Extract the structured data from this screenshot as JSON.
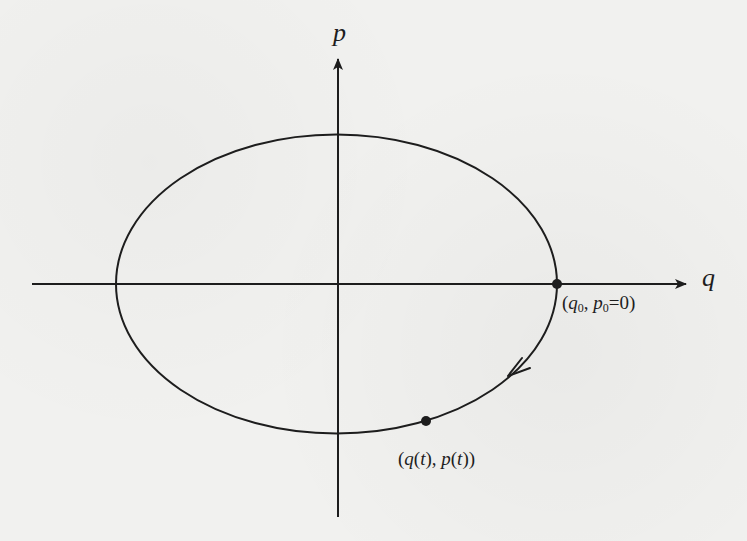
{
  "figure": {
    "type": "phase-space-diagram",
    "axes": {
      "horizontal": {
        "label": "q",
        "from_x": 32,
        "to_x": 688,
        "y": 284
      },
      "vertical": {
        "label": "p",
        "from_y": 517,
        "to_y": 57,
        "x": 338
      }
    },
    "trajectory": {
      "shape": "ellipse",
      "center": [
        336.5,
        284
      ],
      "radius_x": 220.5,
      "radius_y": 149.5,
      "direction": "clockwise",
      "arrow_at": [
        515,
        372
      ]
    },
    "points": [
      {
        "id": "initial",
        "x": 557,
        "y": 284,
        "label_parts": [
          "(",
          "q",
          "0",
          ", ",
          "p",
          "0",
          "=0)"
        ]
      },
      {
        "id": "current",
        "x": 426,
        "y": 421,
        "label_parts": [
          "(",
          "q",
          "(",
          "t",
          "), ",
          "p",
          "(",
          "t",
          "))"
        ]
      }
    ],
    "colors": {
      "ink": "#1d1d1d",
      "paper": "#f1f1ef"
    }
  }
}
